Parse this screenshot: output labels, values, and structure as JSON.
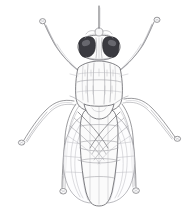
{
  "illustration": {
    "title": "Fly, dorsal view",
    "subject": "fly",
    "view": "dorsal",
    "medium": "pencil line drawing",
    "caption": "",
    "background_color": "#ffffff",
    "line_color": "#6e6e72",
    "eye_color": "#3a3a40",
    "canvas": {
      "width": 196,
      "height": 212
    },
    "parts": [
      {
        "name": "arista",
        "label": "arista"
      },
      {
        "name": "antenna",
        "label": "antenna"
      },
      {
        "name": "compound-eye-left",
        "label": "left compound eye"
      },
      {
        "name": "compound-eye-right",
        "label": "right compound eye"
      },
      {
        "name": "frons",
        "label": "frons"
      },
      {
        "name": "thorax",
        "label": "thorax"
      },
      {
        "name": "scutellum",
        "label": "scutellum"
      },
      {
        "name": "abdomen",
        "label": "abdomen"
      },
      {
        "name": "wing-left",
        "label": "left wing"
      },
      {
        "name": "wing-right",
        "label": "right wing"
      },
      {
        "name": "foreleg-left",
        "label": "left foreleg"
      },
      {
        "name": "foreleg-right",
        "label": "right foreleg"
      },
      {
        "name": "midleg-left",
        "label": "left midleg"
      },
      {
        "name": "midleg-right",
        "label": "right midleg"
      },
      {
        "name": "hindleg-left",
        "label": "left hindleg"
      },
      {
        "name": "hindleg-right",
        "label": "right hindleg"
      }
    ]
  }
}
